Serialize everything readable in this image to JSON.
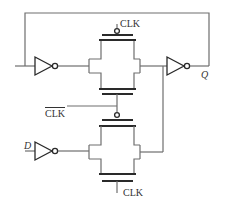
{
  "diagram": {
    "type": "circuit-schematic",
    "labels": {
      "clk_top": "CLK",
      "clk_bar": "CLK",
      "clk_bottom": "CLK",
      "input_d": "D",
      "output_q": "Q"
    },
    "components": [
      {
        "id": "inv-feedback",
        "kind": "inverter"
      },
      {
        "id": "tg-top",
        "kind": "transmission-gate",
        "pmos_gate": "CLK"
      },
      {
        "id": "inv-output",
        "kind": "inverter"
      },
      {
        "id": "inv-input",
        "kind": "inverter"
      },
      {
        "id": "tg-bottom",
        "kind": "transmission-gate",
        "pmos_gate": "CLK_bar",
        "nmos_gate": "CLK"
      }
    ],
    "colors": {
      "wire": "#6e6e6e",
      "device": "#2a2a2a",
      "background": "#ffffff"
    }
  }
}
